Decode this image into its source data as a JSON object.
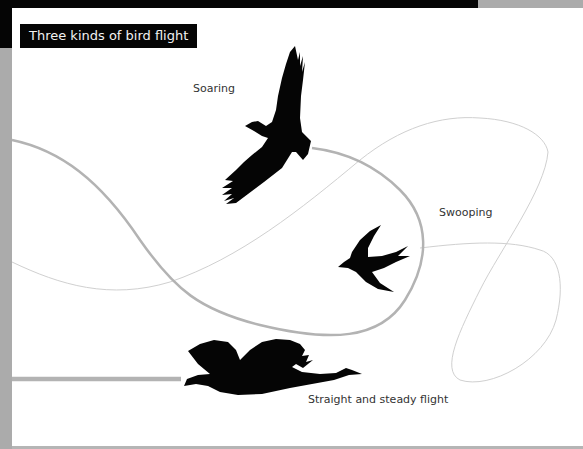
{
  "title": "Three kinds of bird flight",
  "flight_types": [
    {
      "name": "Soaring",
      "bird": "eagle-silhouette"
    },
    {
      "name": "Swooping",
      "bird": "swallow-silhouette"
    },
    {
      "name": "Straight and steady flight",
      "bird": "goose-silhouette"
    }
  ],
  "colors": {
    "frame_dark": "#050505",
    "frame_gray": "#ababab",
    "path_thick": "#b3b3b3",
    "path_thin": "#d0d0d0",
    "bird": "#050505",
    "label": "#333333"
  }
}
